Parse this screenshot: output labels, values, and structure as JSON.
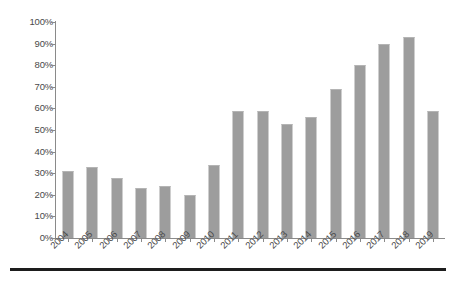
{
  "chart_data": {
    "type": "bar",
    "title": "",
    "subtitle": "",
    "xlabel": "",
    "ylabel": "",
    "categories": [
      "2004",
      "2005",
      "2006",
      "2007",
      "2008",
      "2009",
      "2010",
      "2011",
      "2012",
      "2013",
      "2014",
      "2015",
      "2016",
      "2017",
      "2018",
      "2019"
    ],
    "values": [
      31,
      33,
      28,
      23,
      24,
      20,
      34,
      59,
      59,
      53,
      56,
      69,
      80,
      90,
      93,
      59
    ],
    "series": [
      {
        "name": "",
        "values": [
          31,
          33,
          28,
          23,
          24,
          20,
          34,
          59,
          59,
          53,
          56,
          69,
          80,
          90,
          93,
          59
        ]
      }
    ],
    "ylim": [
      0,
      100
    ],
    "ytick_values": [
      0,
      10,
      20,
      30,
      40,
      50,
      60,
      70,
      80,
      90,
      100
    ],
    "ytick_labels": [
      "0%",
      "10%",
      "20%",
      "30%",
      "40%",
      "50%",
      "60%",
      "70%",
      "80%",
      "90%",
      "100%"
    ],
    "xtick_labels": [
      "2004",
      "2005",
      "2006",
      "2007",
      "2008",
      "2009",
      "2010",
      "2011",
      "2012",
      "2013",
      "2014",
      "2015",
      "2016",
      "2017",
      "2018",
      "2019"
    ],
    "xtick_label_rotation": -45,
    "grid": false,
    "legend": false,
    "legend_position": "none",
    "annotations": [],
    "colors": {
      "bar_fill": "#9d9d9d",
      "bar_top_edge": "#b4b4b4",
      "axis_line": "#8a8a8a",
      "tick_text": "#4a4a4a",
      "background": "#ffffff",
      "bottom_rule": "#1d1d1d"
    }
  }
}
